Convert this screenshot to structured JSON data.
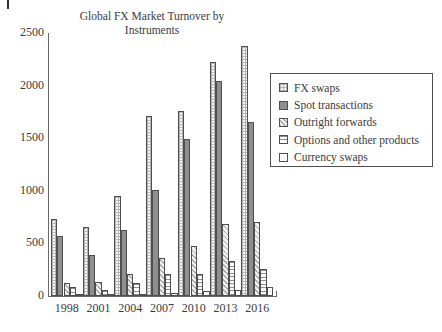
{
  "chart_data": {
    "type": "bar",
    "title": "Global FX Market Turnover by\nInstruments",
    "categories": [
      "1998",
      "2001",
      "2004",
      "2007",
      "2010",
      "2013",
      "2016"
    ],
    "series": [
      {
        "name": "FX swaps",
        "pattern": "grid",
        "values": [
          734,
          656,
          954,
          1714,
          1759,
          2228,
          2378
        ]
      },
      {
        "name": "Spot transactions",
        "pattern": "solid-gray",
        "values": [
          568,
          386,
          631,
          1005,
          1488,
          2046,
          1652
        ]
      },
      {
        "name": "Outright forwards",
        "pattern": "diagonal-hatch",
        "values": [
          128,
          130,
          209,
          362,
          475,
          680,
          700
        ]
      },
      {
        "name": "Options and other products",
        "pattern": "horizontal-lines",
        "values": [
          87,
          60,
          119,
          212,
          207,
          337,
          254
        ]
      },
      {
        "name": "Currency swaps",
        "pattern": "plain",
        "values": [
          10,
          7,
          21,
          31,
          43,
          54,
          82
        ]
      }
    ],
    "xlabel": "",
    "ylabel": "",
    "yticks": [
      0,
      500,
      1000,
      1500,
      2000,
      2500
    ],
    "ylim": [
      0,
      2500
    ],
    "grid": false,
    "legend_position": "right"
  },
  "colors": {
    "axis": "#6a6a6a",
    "text": "#3b3b3b",
    "bar_border": "#4f4f4f",
    "solid_bar_fill": "#8f8f8f",
    "background": "#ffffff"
  }
}
